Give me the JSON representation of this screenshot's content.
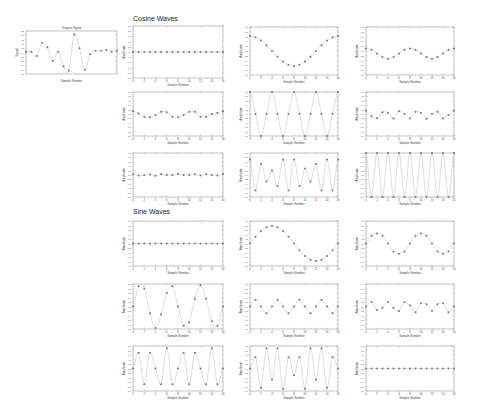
{
  "sections": [
    {
      "title": "Cosine Waves",
      "x": 133,
      "y": 17
    },
    {
      "title": "Sine Waves",
      "x": 133,
      "y": 210
    }
  ],
  "colors": {
    "axis": "#9a9a9a",
    "line": "#c4c4c4",
    "marker": "#777777",
    "text": "#444444"
  },
  "chart_data": [
    {
      "type": "line",
      "title": "Original Signal",
      "xlabel": "Sample Number",
      "ylabel": "Signal",
      "box": [
        26,
        31,
        117,
        74
      ],
      "ylim": [
        -2.5,
        2.5
      ],
      "x": [
        0,
        1,
        2,
        3,
        4,
        5,
        6,
        7,
        8,
        9,
        10,
        11,
        12,
        13,
        14,
        15,
        16,
        17,
        18,
        19,
        20,
        21,
        22,
        23,
        24,
        25,
        26,
        27,
        28,
        29,
        30,
        31
      ],
      "values": [
        0.1,
        0.1,
        -0.4,
        1.1,
        0.6,
        -1.0,
        0.1,
        -1.6,
        -2.1,
        2.1,
        0.5,
        -2.0,
        -0.2,
        0.2,
        0.2,
        0.3,
        0.1,
        0.2
      ]
    },
    {
      "type": "line",
      "group": "Cosine Waves",
      "title": "",
      "xlabel": "Sample Number",
      "ylabel": "Amplitude",
      "box": [
        133,
        26,
        223,
        78
      ],
      "ylim": [
        -1,
        1
      ],
      "x": [
        0,
        16
      ],
      "xticks": [
        "0",
        "2",
        "4",
        "6",
        "8",
        "10",
        "12",
        "14",
        "16"
      ],
      "values": [
        0,
        0,
        0,
        0,
        0,
        0,
        0,
        0,
        0,
        0,
        0,
        0,
        0,
        0,
        0,
        0,
        0
      ]
    },
    {
      "type": "line",
      "group": "Cosine Waves",
      "title": "",
      "xlabel": "Sample Number",
      "ylabel": "Amplitude",
      "box": [
        250,
        27,
        338,
        75
      ],
      "ylim": [
        -1,
        1
      ],
      "x": [
        0,
        16
      ],
      "xticks": [
        "0",
        "2",
        "4",
        "6",
        "8",
        "10",
        "12",
        "14",
        "16"
      ],
      "values": [
        0.62,
        0.57,
        0.44,
        0.24,
        0.0,
        -0.24,
        -0.44,
        -0.57,
        -0.62,
        -0.57,
        -0.44,
        -0.24,
        0.0,
        0.24,
        0.44,
        0.57,
        0.62
      ]
    },
    {
      "type": "line",
      "group": "Cosine Waves",
      "title": "",
      "xlabel": "Sample Number",
      "ylabel": "Amplitude",
      "box": [
        366,
        27,
        454,
        75
      ],
      "ylim": [
        -1,
        1
      ],
      "x": [
        0,
        16
      ],
      "xticks": [
        "0",
        "2",
        "4",
        "6",
        "8",
        "10",
        "12",
        "14",
        "16"
      ],
      "values": [
        0.1,
        0.05,
        -0.1,
        -0.25,
        -0.32,
        -0.25,
        -0.1,
        0.05,
        0.1,
        0.05,
        -0.1,
        -0.25,
        -0.32,
        -0.25,
        -0.1,
        0.05,
        0.1
      ]
    },
    {
      "type": "line",
      "group": "Cosine Waves",
      "title": "",
      "xlabel": "Sample Number",
      "ylabel": "Amplitude",
      "box": [
        133,
        92,
        223,
        136
      ],
      "ylim": [
        -1,
        1
      ],
      "x": [
        0,
        16
      ],
      "xticks": [
        "0",
        "2",
        "4",
        "6",
        "8",
        "10",
        "12",
        "14",
        "16"
      ],
      "values": [
        0.12,
        0.02,
        -0.12,
        -0.15,
        -0.05,
        0.1,
        0.08,
        -0.12,
        -0.15,
        -0.05,
        0.1,
        0.1,
        -0.12,
        -0.12,
        0.0,
        0.05,
        0.12
      ]
    },
    {
      "type": "line",
      "group": "Cosine Waves",
      "title": "",
      "xlabel": "Sample Number",
      "ylabel": "Amplitude",
      "box": [
        250,
        92,
        338,
        136
      ],
      "ylim": [
        -1,
        1
      ],
      "x": [
        0,
        16
      ],
      "xticks": [
        "0",
        "2",
        "4",
        "6",
        "8",
        "10",
        "12",
        "14",
        "16"
      ],
      "values": [
        1,
        0,
        -1,
        0,
        1,
        0,
        -1,
        0,
        1,
        0,
        -1,
        0,
        1,
        0,
        -1,
        0,
        1
      ]
    },
    {
      "type": "line",
      "group": "Cosine Waves",
      "title": "",
      "xlabel": "Sample Number",
      "ylabel": "Amplitude",
      "box": [
        366,
        92,
        454,
        136
      ],
      "ylim": [
        -1,
        1
      ],
      "x": [
        0,
        16
      ],
      "xticks": [
        "0",
        "2",
        "4",
        "6",
        "8",
        "10",
        "12",
        "14",
        "16"
      ],
      "values": [
        0.15,
        -0.1,
        -0.18,
        0.08,
        0.05,
        -0.2,
        0.12,
        0.0,
        -0.2,
        0.1,
        0.05,
        -0.22,
        0.0,
        0.1,
        -0.2,
        -0.05,
        0.15
      ]
    },
    {
      "type": "line",
      "group": "Cosine Waves",
      "title": "",
      "xlabel": "Sample Number",
      "ylabel": "Amplitude",
      "box": [
        133,
        153,
        223,
        197
      ],
      "ylim": [
        -1,
        1
      ],
      "x": [
        0,
        16
      ],
      "xticks": [
        "0",
        "2",
        "4",
        "6",
        "8",
        "10",
        "12",
        "14",
        "16"
      ],
      "values": [
        0.03,
        -0.02,
        -0.01,
        0.02,
        -0.03,
        0.03,
        0.0,
        0.0,
        0.04,
        0.0,
        0.0,
        0.03,
        -0.02,
        0.03,
        0.0,
        -0.02,
        0.04
      ]
    },
    {
      "type": "line",
      "group": "Cosine Waves",
      "title": "",
      "xlabel": "Sample Number",
      "ylabel": "Amplitude",
      "box": [
        250,
        153,
        338,
        197
      ],
      "ylim": [
        -1,
        1
      ],
      "x": [
        0,
        16
      ],
      "xticks": [
        "0",
        "2",
        "4",
        "6",
        "8",
        "10",
        "12",
        "14",
        "16"
      ],
      "values": [
        0.7,
        -0.7,
        0.5,
        -0.3,
        0.2,
        -0.5,
        0.7,
        -0.7,
        0.7,
        -0.5,
        0.3,
        -0.3,
        0.5,
        -0.7,
        0.7,
        -0.7,
        0.7
      ]
    },
    {
      "type": "line",
      "group": "Cosine Waves",
      "title": "",
      "xlabel": "Sample Number",
      "ylabel": "Amplitude",
      "box": [
        366,
        153,
        454,
        197
      ],
      "ylim": [
        -1,
        1
      ],
      "x": [
        0,
        16
      ],
      "xticks": [
        "0",
        "2",
        "4",
        "6",
        "8",
        "10",
        "12",
        "14",
        "16"
      ],
      "values": [
        1,
        -1,
        1,
        -1,
        1,
        -1,
        1,
        -1,
        1,
        -1,
        1,
        -1,
        1,
        -1,
        1,
        -1,
        1
      ]
    },
    {
      "type": "line",
      "group": "Sine Waves",
      "title": "",
      "xlabel": "Sample Number",
      "ylabel": "Amplitude",
      "box": [
        133,
        221,
        223,
        266
      ],
      "ylim": [
        -1,
        1
      ],
      "x": [
        0,
        16
      ],
      "xticks": [
        "0",
        "2",
        "4",
        "6",
        "8",
        "10",
        "12",
        "14",
        "16"
      ],
      "values": [
        0,
        0,
        0,
        0,
        0,
        0,
        0,
        0,
        0,
        0,
        0,
        0,
        0,
        0,
        0,
        0,
        0
      ]
    },
    {
      "type": "line",
      "group": "Sine Waves",
      "title": "",
      "xlabel": "Sample Number",
      "ylabel": "Amplitude",
      "box": [
        250,
        221,
        338,
        266
      ],
      "ylim": [
        -1,
        1
      ],
      "x": [
        0,
        16
      ],
      "xticks": [
        "0",
        "2",
        "4",
        "6",
        "8",
        "10",
        "12",
        "14",
        "16"
      ],
      "values": [
        0,
        0.3,
        0.55,
        0.72,
        0.78,
        0.72,
        0.55,
        0.3,
        0,
        -0.3,
        -0.55,
        -0.72,
        -0.78,
        -0.72,
        -0.55,
        -0.3,
        0
      ]
    },
    {
      "type": "line",
      "group": "Sine Waves",
      "title": "",
      "xlabel": "Sample Number",
      "ylabel": "Amplitude",
      "box": [
        366,
        221,
        454,
        266
      ],
      "ylim": [
        -1,
        1
      ],
      "x": [
        0,
        16
      ],
      "xticks": [
        "0",
        "2",
        "4",
        "6",
        "8",
        "10",
        "12",
        "14",
        "16"
      ],
      "values": [
        0,
        0.35,
        0.45,
        0.35,
        0,
        -0.35,
        -0.45,
        -0.35,
        0,
        0.35,
        0.45,
        0.35,
        0,
        -0.35,
        -0.45,
        -0.35,
        0
      ]
    },
    {
      "type": "line",
      "group": "Sine Waves",
      "title": "",
      "xlabel": "Sample Number",
      "ylabel": "Amplitude",
      "box": [
        133,
        284,
        223,
        329
      ],
      "ylim": [
        -1,
        1
      ],
      "x": [
        0,
        16
      ],
      "xticks": [
        "0",
        "2",
        "4",
        "6",
        "8",
        "10",
        "12",
        "14",
        "16"
      ],
      "values": [
        0,
        0.9,
        0.8,
        -0.3,
        -0.95,
        -0.35,
        0.6,
        0.9,
        0,
        -0.85,
        -0.7,
        0.35,
        0.95,
        0.35,
        -0.65,
        -0.85,
        0
      ]
    },
    {
      "type": "line",
      "group": "Sine Waves",
      "title": "",
      "xlabel": "Sample Number",
      "ylabel": "Amplitude",
      "box": [
        250,
        284,
        338,
        329
      ],
      "ylim": [
        -1,
        1
      ],
      "x": [
        0,
        16
      ],
      "xticks": [
        "0",
        "2",
        "4",
        "6",
        "8",
        "10",
        "12",
        "14",
        "16"
      ],
      "values": [
        0,
        0.3,
        0,
        -0.3,
        0,
        0.3,
        0,
        -0.3,
        0,
        0.3,
        0,
        -0.3,
        0,
        0.3,
        0,
        -0.3,
        0
      ]
    },
    {
      "type": "line",
      "group": "Sine Waves",
      "title": "",
      "xlabel": "Sample Number",
      "ylabel": "Amplitude",
      "box": [
        366,
        284,
        454,
        329
      ],
      "ylim": [
        -1,
        1
      ],
      "x": [
        0,
        16
      ],
      "xticks": [
        "0",
        "2",
        "4",
        "6",
        "8",
        "10",
        "12",
        "14",
        "16"
      ],
      "values": [
        0,
        0.2,
        -0.15,
        -0.05,
        0.2,
        -0.05,
        -0.2,
        0.2,
        0.05,
        -0.25,
        0.15,
        0.1,
        -0.2,
        0.1,
        0.15,
        -0.25,
        0
      ]
    },
    {
      "type": "line",
      "group": "Sine Waves",
      "title": "",
      "xlabel": "Sample Number",
      "ylabel": "Amplitude",
      "box": [
        133,
        346,
        223,
        391
      ],
      "ylim": [
        -1,
        1
      ],
      "x": [
        0,
        16
      ],
      "xticks": [
        "0",
        "2",
        "4",
        "6",
        "8",
        "10",
        "12",
        "14",
        "16"
      ],
      "values": [
        0,
        0.7,
        -0.7,
        0.7,
        0,
        -0.7,
        0.9,
        -0.7,
        0,
        0.7,
        -0.7,
        0.7,
        0,
        -0.7,
        0.9,
        -0.7,
        0
      ]
    },
    {
      "type": "line",
      "group": "Sine Waves",
      "title": "",
      "xlabel": "Sample Number",
      "ylabel": "Amplitude",
      "box": [
        250,
        346,
        338,
        391
      ],
      "ylim": [
        -1,
        1
      ],
      "x": [
        0,
        16
      ],
      "xticks": [
        "0",
        "2",
        "4",
        "6",
        "8",
        "10",
        "12",
        "14",
        "16"
      ],
      "values": [
        0,
        0.5,
        -0.85,
        0.9,
        -0.5,
        0.9,
        -0.9,
        0.5,
        -0.3,
        0.5,
        -0.9,
        0.9,
        -0.5,
        0.9,
        -0.85,
        0.5,
        0
      ]
    },
    {
      "type": "line",
      "group": "Sine Waves",
      "title": "",
      "xlabel": "Sample Number",
      "ylabel": "Amplitude",
      "box": [
        366,
        346,
        454,
        391
      ],
      "ylim": [
        -1,
        1
      ],
      "x": [
        0,
        16
      ],
      "xticks": [
        "0",
        "2",
        "4",
        "6",
        "8",
        "10",
        "12",
        "14",
        "16"
      ],
      "values": [
        0,
        0,
        0,
        0,
        0,
        0,
        0,
        0,
        0,
        0,
        0,
        0,
        0,
        0,
        0,
        0,
        0
      ]
    }
  ]
}
